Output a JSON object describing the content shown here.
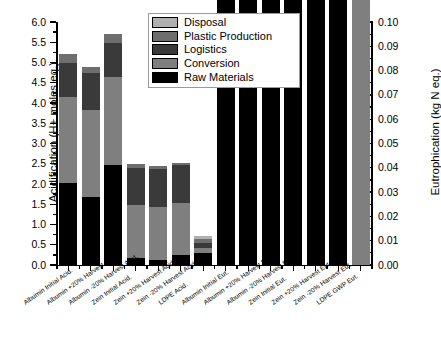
{
  "axes": {
    "left": {
      "title": "Acidification (H+ moles eq.)",
      "ticks": [
        "0.0",
        "0.5",
        "1.0",
        "1.5",
        "2.0",
        "2.5",
        "3.0",
        "3.5",
        "4.0",
        "4.5",
        "5.0",
        "5.5",
        "6.0"
      ],
      "min": 0.0,
      "max": 6.0,
      "step": 0.5
    },
    "right": {
      "title": "Eutrophication (kg N eq.)",
      "ticks": [
        "0.00",
        "0.01",
        "0.02",
        "0.03",
        "0.04",
        "0.05",
        "0.06",
        "0.07",
        "0.08",
        "0.09",
        "0.10"
      ],
      "min": 0.0,
      "max": 0.1,
      "step": 0.01
    }
  },
  "legend": {
    "entries": [
      {
        "label": "Disposal",
        "color": "#b0b0b0"
      },
      {
        "label": "Plastic Production",
        "color": "#6e6e6e"
      },
      {
        "label": "Logistics",
        "color": "#3a3a3a"
      },
      {
        "label": "Conversion",
        "color": "#7f7f7f"
      },
      {
        "label": "Raw Materials",
        "color": "#000000"
      }
    ]
  },
  "caption": "",
  "chart_data": {
    "type": "bar",
    "title": "",
    "subtitle": "",
    "stacked": true,
    "grid": false,
    "legend_position": "top-center",
    "xlabel": "",
    "ylabel": "Acidification (H+ moles eq.)",
    "y2label": "Eutrophication (kg N eq.)",
    "ylim": [
      0.0,
      6.0
    ],
    "y2lim": [
      0.0,
      0.1
    ],
    "categories": [
      "Albumin Initial Acid.",
      "Albumin +20% Harvest Acid.",
      "Albumin -20% Harvest Acid.",
      "Zein Initial Acid.",
      "Zein +20% Harvest Acid.",
      "Zein -20% Harvest Acid.",
      "LDPE Acid.",
      "Albumin Initial Eut.",
      "Albumin +20% Harvest Eut.",
      "Albumin -20% Harvest Eut.",
      "Zein Initial Eut.",
      "Zein +20% Harvest Eut.",
      "Zein -20% Harvest Eut.",
      "LDPE GWP Eut."
    ],
    "axis_assignment": [
      "left",
      "left",
      "left",
      "left",
      "left",
      "left",
      "left",
      "right",
      "right",
      "right",
      "right",
      "right",
      "right",
      "right"
    ],
    "series": [
      {
        "name": "Raw Materials",
        "color": "#000000",
        "values": [
          2.02,
          1.68,
          2.47,
          0.18,
          0.13,
          0.25,
          0.3,
          1.47,
          1.22,
          1.88,
          0.52,
          0.45,
          0.58,
          0.0
        ]
      },
      {
        "name": "Conversion",
        "color": "#7f7f7f",
        "values": [
          2.12,
          2.15,
          2.17,
          1.3,
          1.3,
          1.28,
          0.13,
          1.92,
          1.95,
          1.98,
          3.7,
          3.72,
          3.68,
          0.82
        ]
      },
      {
        "name": "Logistics",
        "color": "#3a3a3a",
        "values": [
          0.86,
          0.92,
          0.84,
          0.92,
          0.93,
          0.95,
          0.12,
          0.2,
          0.27,
          0.27,
          0.32,
          0.33,
          0.32,
          0.25
        ]
      },
      {
        "name": "Plastic Production",
        "color": "#6e6e6e",
        "values": [
          0.2,
          0.15,
          0.22,
          0.1,
          0.09,
          0.05,
          0.1,
          0.0,
          0.0,
          0.0,
          0.0,
          0.0,
          0.0,
          0.0
        ]
      },
      {
        "name": "Disposal",
        "color": "#b0b0b0",
        "values": [
          0.0,
          0.0,
          0.0,
          0.0,
          0.0,
          0.0,
          0.07,
          0.03,
          0.03,
          0.03,
          0.0,
          0.0,
          0.0,
          0.45
        ]
      }
    ],
    "totals": [
      5.2,
      4.9,
      5.7,
      2.5,
      2.45,
      2.53,
      0.72,
      3.62,
      3.47,
      4.16,
      4.54,
      4.5,
      4.58,
      1.52
    ]
  }
}
